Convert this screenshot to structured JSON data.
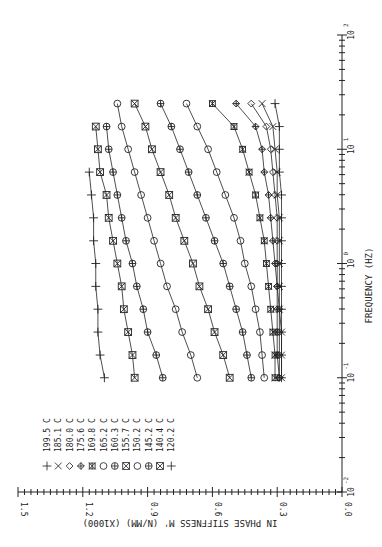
{
  "chart_data": {
    "type": "line",
    "orientation": "rotated-90-ccw",
    "title": "",
    "xlabel": "FREQUENCY  (HZ)",
    "ylabel": "IN PHASE STIFFNESS M'  (N/MM)  (X1000)",
    "xscale": "log",
    "xlim": [
      0.01,
      100
    ],
    "ylim": [
      0.0,
      1.5
    ],
    "x_ticks": [
      "10^-2",
      "10^-1",
      "10^0",
      "10^1",
      "10^2"
    ],
    "y_ticks": [
      "0.0",
      "0.3",
      "0.6",
      "0.9",
      "1.2",
      "1.5"
    ],
    "grid": false,
    "legend_position": "upper-left",
    "x": [
      0.1,
      0.158,
      0.251,
      0.398,
      0.631,
      1.0,
      1.58,
      2.51,
      3.98,
      6.31,
      10.0,
      15.8,
      25.1
    ],
    "series": [
      {
        "name": "199.5 C",
        "marker": "plus",
        "color": "#6b8e23",
        "values": [
          0.28,
          0.28,
          0.28,
          0.28,
          0.28,
          0.28,
          0.28,
          0.28,
          0.28,
          0.29,
          0.29,
          0.29,
          0.31
        ]
      },
      {
        "name": "185.1 C",
        "marker": "x",
        "color": "#222222",
        "values": [
          0.28,
          0.28,
          0.28,
          0.29,
          0.29,
          0.29,
          0.29,
          0.29,
          0.3,
          0.3,
          0.31,
          0.32,
          0.37
        ]
      },
      {
        "name": "180.0 C",
        "marker": "diamond",
        "color": "#b03030",
        "values": [
          0.29,
          0.29,
          0.29,
          0.29,
          0.3,
          0.3,
          0.3,
          0.3,
          0.31,
          0.32,
          0.33,
          0.35,
          0.42
        ]
      },
      {
        "name": "175.6 C",
        "marker": "diamond-plus",
        "color": "#b03030",
        "values": [
          0.29,
          0.3,
          0.3,
          0.3,
          0.3,
          0.31,
          0.32,
          0.33,
          0.34,
          0.36,
          0.37,
          0.4,
          0.49
        ]
      },
      {
        "name": "169.8 C",
        "marker": "asterisk-box",
        "color": "#7a3f7a",
        "values": [
          0.31,
          0.31,
          0.32,
          0.33,
          0.34,
          0.35,
          0.36,
          0.38,
          0.4,
          0.43,
          0.46,
          0.5,
          0.6
        ]
      },
      {
        "name": "165.2 C",
        "marker": "circle",
        "color": "#7a3f7a",
        "values": [
          0.36,
          0.37,
          0.38,
          0.4,
          0.42,
          0.45,
          0.47,
          0.5,
          0.54,
          0.58,
          0.62,
          0.67,
          0.72
        ]
      },
      {
        "name": "160.3 C",
        "marker": "circle-plus",
        "color": "#222222",
        "values": [
          0.42,
          0.44,
          0.46,
          0.49,
          0.52,
          0.55,
          0.59,
          0.63,
          0.67,
          0.71,
          0.75,
          0.79,
          0.84
        ]
      },
      {
        "name": "155.7 C",
        "marker": "box-x",
        "color": "#222222",
        "values": [
          0.52,
          0.55,
          0.59,
          0.62,
          0.66,
          0.69,
          0.73,
          0.77,
          0.8,
          0.84,
          0.88,
          0.91,
          0.96
        ]
      },
      {
        "name": "150.2 C",
        "marker": "circle",
        "color": "#2e8b8b",
        "values": [
          0.67,
          0.7,
          0.74,
          0.77,
          0.81,
          0.84,
          0.87,
          0.9,
          0.93,
          0.96,
          0.99,
          1.02,
          1.04
        ]
      },
      {
        "name": "145.2 C",
        "marker": "circle-plus",
        "color": "#222222",
        "values": [
          0.83,
          0.86,
          0.9,
          0.92,
          0.95,
          0.97,
          1.0,
          1.02,
          1.04,
          1.06,
          1.08,
          1.09,
          null
        ]
      },
      {
        "name": "140.4 C",
        "marker": "box-x",
        "color": "#222222",
        "values": [
          0.96,
          0.97,
          0.99,
          1.01,
          1.02,
          1.04,
          1.06,
          1.08,
          1.09,
          1.12,
          1.13,
          1.14,
          null
        ]
      },
      {
        "name": "120.2 C",
        "marker": "plus",
        "color": "#222222",
        "values": [
          1.1,
          1.12,
          1.13,
          1.13,
          1.14,
          1.14,
          1.15,
          1.15,
          1.16,
          1.17,
          null,
          null,
          null
        ]
      }
    ]
  },
  "legend": {
    "entries": [
      "199.5 C",
      "185.1 C",
      "180.0 C",
      "175.6 C",
      "169.8 C",
      "165.2 C",
      "160.3 C",
      "155.7 C",
      "150.2 C",
      "145.2 C",
      "140.4 C",
      "120.2 C"
    ]
  },
  "axes": {
    "x_label": "FREQUENCY  (HZ)",
    "y_label_main": "IN PHASE STIFFNESS M'",
    "y_label_units": "(N/MM)",
    "y_label_scale": "(X1000)"
  }
}
